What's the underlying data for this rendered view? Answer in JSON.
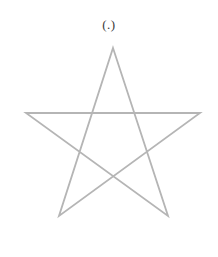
{
  "figure": {
    "caption": "(.)",
    "caption_color": "#3a3a3a",
    "caption_font_size": "13px",
    "background_color": "#ffffff",
    "shape_name": "pentagram",
    "shape_description": "five-pointed star drawn with five straight intersecting lines",
    "stroke_color": "#b5b5b5",
    "stroke_width": "1.8",
    "vertex_count": "5",
    "points": [
      {
        "name": "top",
        "x": 113,
        "y": 10
      },
      {
        "name": "bottom-right",
        "x": 168,
        "y": 178
      },
      {
        "name": "left",
        "x": 26,
        "y": 75
      },
      {
        "name": "right",
        "x": 200,
        "y": 75
      },
      {
        "name": "bottom-left",
        "x": 59,
        "y": 178
      }
    ],
    "path_d": "M 113 10 L 168 178 L 26 75 L 200 75 L 59 178 Z"
  }
}
